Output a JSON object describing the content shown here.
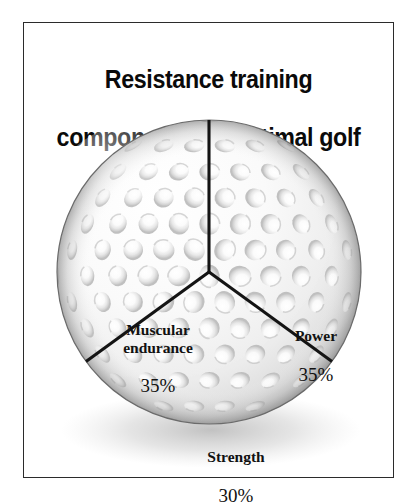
{
  "figure": {
    "title_line_1": "Resistance training",
    "title_line_2": "components for optimal golf",
    "frame_color": "#2b2b2b",
    "background_color": "#ffffff"
  },
  "chart_data": {
    "type": "pie",
    "title": "Resistance training components for optimal golf",
    "xlabel": "",
    "ylabel": "",
    "units": "%",
    "legend": "none",
    "grid": false,
    "start_angle_deg": 0,
    "direction": "clockwise",
    "styling": {
      "motif": "golf-ball",
      "slice_fill": "golf-ball-surface",
      "divider_color": "#111111",
      "divider_width_px": 3,
      "outline_color": "#555555",
      "shadow_color": "#bdbdbd"
    },
    "categories": [
      "Power",
      "Strength",
      "Muscular endurance"
    ],
    "values": [
      35,
      30,
      35
    ],
    "slices": [
      {
        "label": "Power",
        "value": 35,
        "value_text": "35%",
        "start_deg": 0,
        "end_deg": 126
      },
      {
        "label": "Strength",
        "value": 30,
        "value_text": "30%",
        "start_deg": 126,
        "end_deg": 234
      },
      {
        "label": "Muscular endurance",
        "value": 35,
        "value_text": "35%",
        "start_deg": 234,
        "end_deg": 360
      }
    ]
  },
  "labels": {
    "endurance": {
      "name": "Muscular\nendurance",
      "value": "35%"
    },
    "power": {
      "name": "Power",
      "value": "35%"
    },
    "strength": {
      "name": "Strength",
      "value": "30%"
    }
  }
}
